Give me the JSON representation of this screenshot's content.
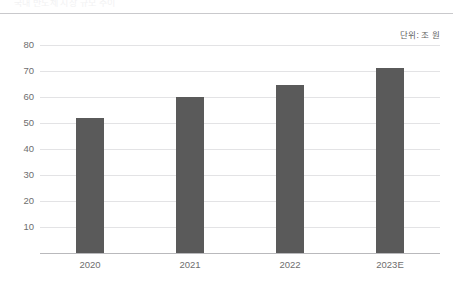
{
  "header": {
    "clipped_text": "국내 반도체 시장 규모 추이"
  },
  "unit_caption": "단위: 조 원",
  "chart_data": {
    "type": "bar",
    "title": "",
    "xlabel": "",
    "ylabel": "",
    "unit": "단위: 조 원",
    "categories": [
      "2020",
      "2021",
      "2022",
      "2023E"
    ],
    "values": [
      52,
      60,
      64.5,
      71
    ],
    "series": [
      {
        "name": "조 원",
        "values": [
          52,
          60,
          64.5,
          71
        ]
      }
    ],
    "ylim": [
      0,
      80
    ],
    "ytick_labels": [
      "10",
      "20",
      "30",
      "40",
      "50",
      "60",
      "70",
      "80"
    ],
    "ytick_values": [
      10,
      20,
      30,
      40,
      50,
      60,
      70,
      80
    ],
    "grid": true,
    "legend": false,
    "bar_color": "#5a5a5a",
    "grid_color": "#e3e3e5",
    "axis_color": "#b9b9bc"
  }
}
